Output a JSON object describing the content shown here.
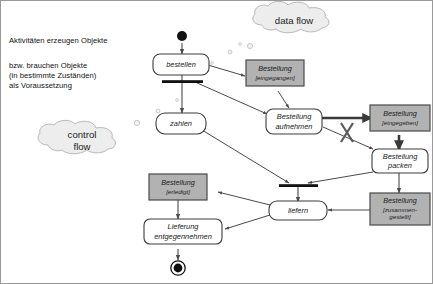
{
  "diagram": {
    "annotation": {
      "line1": "Aktivitäten erzeugen Objekte",
      "line2": "bzw. brauchen Objekte\n(in bestimmte Zuständen)\nals Voraussetzung"
    },
    "clouds": [
      {
        "id": "data-flow",
        "label": "data flow"
      },
      {
        "id": "control-flow",
        "label": "control\nflow"
      }
    ],
    "activities": [
      {
        "id": "bestellen",
        "label": "bestellen"
      },
      {
        "id": "zahlen",
        "label": "zahlen"
      },
      {
        "id": "bestellung-aufnehmen",
        "label": "Bestellung\naufnehmen"
      },
      {
        "id": "bestellung-packen",
        "label": "Bestellung\npacken"
      },
      {
        "id": "liefern",
        "label": "liefern"
      },
      {
        "id": "lieferung-entgegennehmen",
        "label": "Lieferung\nentgegennehmen"
      }
    ],
    "objects": [
      {
        "id": "bestellung-eingegangen",
        "name": "Bestellung",
        "state": "[eingegangen]"
      },
      {
        "id": "bestellung-eingegeben",
        "name": "Bestellung",
        "state": "[eingegeben]"
      },
      {
        "id": "bestellung-zusammengestellt",
        "name": "Bestellung",
        "state": "[zusammen-\ngestellt]"
      },
      {
        "id": "bestellung-erledigt",
        "name": "Bestellung",
        "state": "[erledigt]"
      }
    ],
    "control_nodes": [
      {
        "id": "start-node",
        "type": "initial"
      },
      {
        "id": "fork-bar",
        "type": "fork"
      },
      {
        "id": "join-bar",
        "type": "join"
      },
      {
        "id": "end-node",
        "type": "final"
      }
    ],
    "markers": [
      {
        "id": "cross-out-marker",
        "type": "x-cross"
      }
    ],
    "colors": {
      "object_fill": "#b2b2b2",
      "object_border": "#4a4a4a",
      "activity_fill": "#ffffff",
      "activity_border": "#3c3c3c",
      "cloud_fill": "#ededed",
      "cloud_border": "#b9b9b9",
      "edge": "#4a4a4a",
      "frame": "#9a9a9a",
      "text": "#1a1a1a"
    }
  }
}
